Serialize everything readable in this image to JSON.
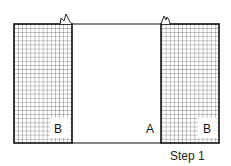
{
  "diagram": {
    "type": "sewing-step",
    "panels": [
      {
        "id": "left",
        "label": "B",
        "pattern": "grid"
      },
      {
        "id": "center",
        "label": "A",
        "pattern": "plain"
      },
      {
        "id": "right",
        "label": "B",
        "pattern": "grid"
      }
    ],
    "caption": "Step 1",
    "colors": {
      "line": "#111111",
      "grid": "#333333",
      "background": "#ffffff"
    }
  }
}
